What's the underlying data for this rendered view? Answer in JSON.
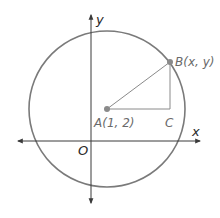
{
  "diagram": {
    "type": "coordinate-geometry",
    "colors": {
      "circle": "#7a7a7a",
      "axes": "#3a3a3a",
      "points": "#8a8a8a",
      "segments": "#8a8a8a",
      "point_labels": "#6a6a6a",
      "axis_labels": "#2a2a2a"
    },
    "axes": {
      "x_label": "x",
      "y_label": "y",
      "origin_label": "O"
    },
    "points": {
      "A": {
        "label": "A(1, 2)",
        "role": "circle center"
      },
      "B": {
        "label": "B(x, y)",
        "role": "point on circle"
      },
      "C": {
        "label": "C",
        "role": "right-angle vertex"
      }
    },
    "segments": [
      {
        "from": "A",
        "to": "B",
        "role": "radius"
      },
      {
        "from": "A",
        "to": "C",
        "role": "horizontal leg"
      },
      {
        "from": "C",
        "to": "B",
        "role": "vertical leg"
      }
    ]
  }
}
